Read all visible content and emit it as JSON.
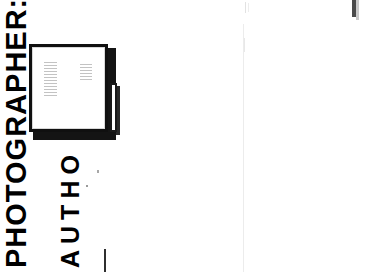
{
  "document": {
    "background_color": "#ffffff",
    "width": 367,
    "height": 272,
    "kind": "scanned-page-fragment"
  },
  "labels": {
    "photographer": "PHOTOGRAPHER:",
    "author": "AUTHO"
  },
  "card": {
    "border_color": "#101010",
    "fill_color": "#ffffff",
    "shadow_color": "#141414",
    "body_text_left": [
      "",
      "",
      "",
      "",
      "",
      "",
      "",
      "",
      "",
      "",
      "",
      ""
    ],
    "body_text_right": [
      "",
      "",
      "",
      "",
      "",
      ""
    ]
  },
  "artifacts": {
    "vertical_rule_color": "#ececec",
    "corner_bar_color": "#4a4a4a",
    "bottom_mark_color": "#2f2f2f"
  }
}
